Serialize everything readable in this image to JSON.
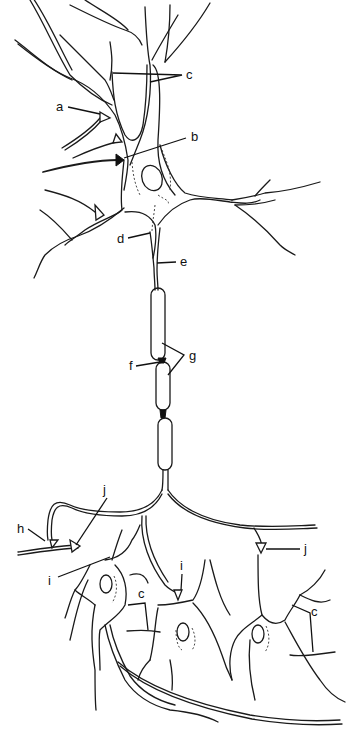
{
  "diagram": {
    "labels": {
      "a": "a",
      "b": "b",
      "c_top": "c",
      "d": "d",
      "e": "e",
      "f": "f",
      "g": "g",
      "h": "h",
      "i_left": "i",
      "i_middle": "i",
      "j_top": "j",
      "j_right": "j",
      "c_bottom_left": "c",
      "c_bottom_right": "c"
    }
  }
}
